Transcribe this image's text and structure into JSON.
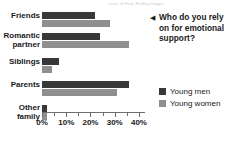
{
  "watermark": "nose_of Fred, Fredtry Images",
  "question": {
    "arrow_icon": "left-triangle-icon",
    "text": "Who do you rely on for emotional support?"
  },
  "legend": {
    "items": [
      {
        "label": "Young men",
        "color": "#383838"
      },
      {
        "label": "Young women",
        "color": "#8f8f8f"
      }
    ]
  },
  "axis": {
    "ticks": [
      "0%",
      "",
      "10%",
      "",
      "20%",
      "",
      "30%",
      "",
      "40%"
    ],
    "labels": [
      "0%",
      "10%",
      "20%",
      "30%",
      "40%"
    ],
    "min": 0,
    "max": 42.5
  },
  "chart_data": {
    "type": "bar",
    "orientation": "horizontal",
    "title": "Who do you rely on for emotional support?",
    "xlabel": "",
    "ylabel": "",
    "xlim": [
      0,
      42.5
    ],
    "grid": false,
    "legend_position": "right",
    "categories": [
      "Friends",
      "Romantic partner",
      "Siblings",
      "Parents",
      "Other family"
    ],
    "series": [
      {
        "name": "Young men",
        "color": "#383838",
        "values": [
          22,
          24,
          7,
          36,
          2
        ]
      },
      {
        "name": "Young women",
        "color": "#8f8f8f",
        "values": [
          28,
          36,
          4,
          31,
          2
        ]
      }
    ],
    "xtick_labels": [
      "0%",
      "10%",
      "20%",
      "30%",
      "40%"
    ],
    "xtick_values": [
      0,
      10,
      20,
      30,
      40
    ]
  }
}
